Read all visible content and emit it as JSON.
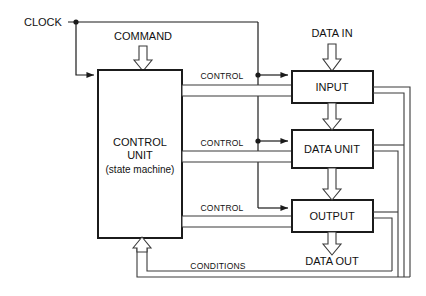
{
  "diagram": {
    "colors": {
      "background": "#ffffff",
      "stroke": "#1b1b1b",
      "bus_stroke": "#3a3a3a",
      "text": "#111111"
    },
    "signals": {
      "clock": "CLOCK",
      "command": "COMMAND",
      "data_in": "DATA IN",
      "data_out": "DATA OUT",
      "conditions": "CONDITIONS",
      "control_1": "CONTROL",
      "control_2": "CONTROL",
      "control_3": "CONTROL"
    },
    "blocks": {
      "control_unit": {
        "line1": "CONTROL",
        "line2": "UNIT",
        "line3": "(state machine)"
      },
      "input": {
        "label": "INPUT"
      },
      "data_unit": {
        "label": "DATA UNIT"
      },
      "output": {
        "label": "OUTPUT"
      }
    }
  }
}
